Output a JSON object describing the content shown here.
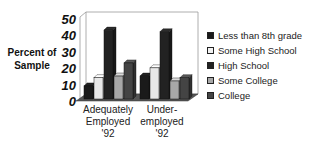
{
  "chart_data": {
    "type": "bar",
    "title": "",
    "xlabel": "",
    "ylabel": "Percent of Sample",
    "ylim": [
      0,
      50
    ],
    "yticks": [
      "50",
      "40",
      "30",
      "20",
      "10",
      "0"
    ],
    "categories": [
      "Adequately Employed '92",
      "Under-employed '92"
    ],
    "category_lines": [
      [
        "Adequately",
        "Employed",
        "'92"
      ],
      [
        "Under-",
        "employed",
        "'92"
      ]
    ],
    "series": [
      {
        "name": "Less than 8th grade",
        "color": "#1a1a1a",
        "values": [
          8,
          14
        ]
      },
      {
        "name": "Some High School",
        "color": "#e8e8e8",
        "values": [
          13,
          19
        ]
      },
      {
        "name": "High School",
        "color": "#222222",
        "values": [
          42,
          41
        ]
      },
      {
        "name": "Some College",
        "color": "#a8a8a8",
        "values": [
          14,
          11
        ]
      },
      {
        "name": "College",
        "color": "#444444",
        "values": [
          22,
          13
        ]
      }
    ],
    "legend_position": "right",
    "grid": false,
    "style": "3d"
  },
  "ylabel_lines": [
    "Percent of",
    "Sample"
  ]
}
